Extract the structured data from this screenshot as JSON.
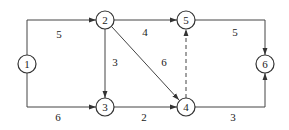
{
  "diagram": {
    "type": "network-graph",
    "nodes": [
      {
        "id": "1",
        "label": "1",
        "x": 27,
        "y": 64
      },
      {
        "id": "2",
        "label": "2",
        "x": 105,
        "y": 20
      },
      {
        "id": "3",
        "label": "3",
        "x": 105,
        "y": 107
      },
      {
        "id": "4",
        "label": "4",
        "x": 186,
        "y": 107
      },
      {
        "id": "5",
        "label": "5",
        "x": 186,
        "y": 20
      },
      {
        "id": "6",
        "label": "6",
        "x": 265,
        "y": 64
      }
    ],
    "edges": [
      {
        "from": "1",
        "to": "2",
        "weight": "5",
        "style": "solid"
      },
      {
        "from": "1",
        "to": "3",
        "weight": "6",
        "style": "solid"
      },
      {
        "from": "2",
        "to": "3",
        "weight": "3",
        "style": "solid"
      },
      {
        "from": "2",
        "to": "5",
        "weight": "4",
        "style": "solid"
      },
      {
        "from": "2",
        "to": "4",
        "weight": "6",
        "style": "solid"
      },
      {
        "from": "3",
        "to": "4",
        "weight": "2",
        "style": "solid"
      },
      {
        "from": "4",
        "to": "5",
        "weight": "",
        "style": "dashed"
      },
      {
        "from": "5",
        "to": "6",
        "weight": "5",
        "style": "solid"
      },
      {
        "from": "4",
        "to": "6",
        "weight": "3",
        "style": "solid"
      }
    ]
  }
}
